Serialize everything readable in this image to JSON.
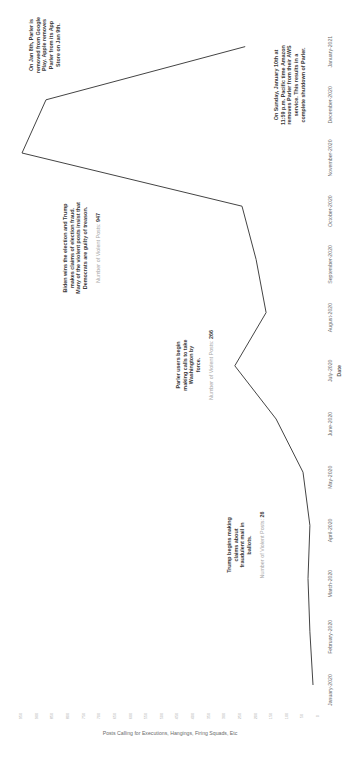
{
  "chart_data": {
    "type": "line",
    "orientation": "rotated-90-clockwise",
    "title": "",
    "xlabel": "Date",
    "ylabel": "Posts Calling for Executions, Hangings, Firing Squads, Etc",
    "categories": [
      "January-2020",
      "February-2020",
      "March-2020",
      "April-2020",
      "May-2020",
      "June-2020",
      "July-2020",
      "August-2020",
      "September-2020",
      "October-2020",
      "November-2020",
      "December-2020",
      "January-2021"
    ],
    "series": [
      {
        "name": "Posts Calling for Executions, Hangings, Firing Squads, Etc",
        "values": [
          16,
          26,
          32,
          26,
          48,
          134,
          266,
          166,
          198,
          243,
          947,
          870,
          233
        ]
      }
    ],
    "ylim": [
      0,
      950
    ],
    "yticks": [
      0,
      50,
      100,
      150,
      200,
      250,
      300,
      350,
      400,
      450,
      500,
      550,
      600,
      650,
      700,
      750,
      800,
      850,
      900,
      950
    ],
    "grid": false,
    "legend": "none",
    "annotations": [
      {
        "id": "trump-mail",
        "category": "April-2020",
        "lines": [
          "Trump begins making",
          "claims about",
          "fraudulent mail in",
          "ballots."
        ],
        "count_label": "Number of Violent Posts:",
        "count_value": "26"
      },
      {
        "id": "washington-force",
        "category": "July-2020",
        "lines": [
          "Parler users begin",
          "making calls to take",
          "Washington by",
          "force."
        ],
        "count_label": "Number of Violent Posts:",
        "count_value": "266"
      },
      {
        "id": "biden-wins",
        "category": "November-2020",
        "lines": [
          "Biden wins the election and Trump",
          "makes claims of election fraud.",
          "Many of the violent posts insist that",
          "Democrats are guilty of treason."
        ],
        "count_label": "Number of Violent Posts:",
        "count_value": "947"
      },
      {
        "id": "google-apple",
        "category": "December-2020",
        "lines": [
          "On Jan 8th, Parler is",
          "removed from Google",
          "Play. Apple removes",
          "Parler from its App",
          "Store on Jan 9th."
        ]
      },
      {
        "id": "aws-shutdown",
        "category": "January-2021",
        "lines": [
          "On Sunday, January 10th at",
          "11:59 p.m. Pacific time Amazon",
          "removes Parler from their AWS",
          "service. This results in a",
          "complete shutdown of Parler."
        ]
      }
    ]
  },
  "colors": {
    "line": "#444444",
    "annotation_text": "#3a3a3a",
    "muted_text": "#a8a8a8",
    "tick_text": "#b5b5b5"
  }
}
